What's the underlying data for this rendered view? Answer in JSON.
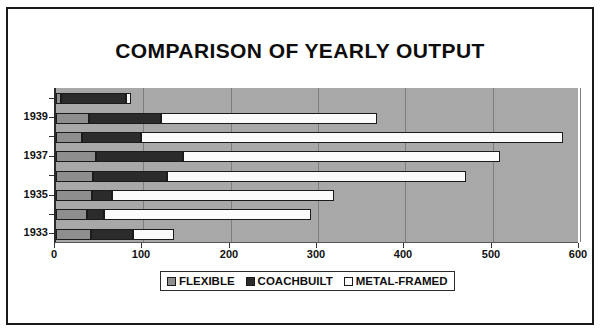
{
  "chart_data": {
    "type": "bar",
    "orientation": "horizontal",
    "stacked": true,
    "title": "COMPARISON OF YEARLY OUTPUT",
    "xlabel": "",
    "ylabel": "",
    "xlim": [
      0,
      600
    ],
    "xticks": [
      "0",
      "100",
      "200",
      "300",
      "400",
      "500",
      "600"
    ],
    "xtick_values": [
      0,
      100,
      200,
      300,
      400,
      500,
      600
    ],
    "grid": true,
    "grid_axis": "x",
    "legend_position": "bottom",
    "categories": [
      "1933",
      "1934",
      "1935",
      "1936",
      "1937",
      "1938",
      "1939",
      "1940"
    ],
    "visible_ytick_labels": [
      "1939",
      "1937",
      "1935",
      "1933"
    ],
    "series": [
      {
        "name": "FLEXIBLE",
        "color": "#8e8e8e",
        "values": [
          40,
          36,
          41,
          42,
          46,
          30,
          38,
          6
        ]
      },
      {
        "name": "COACHBUILT",
        "color": "#2b2b2b",
        "values": [
          48,
          19,
          23,
          85,
          99,
          67,
          82,
          74
        ]
      },
      {
        "name": "METAL-FRAMED",
        "color": "#fbfbfb",
        "values": [
          47,
          237,
          254,
          343,
          363,
          483,
          248,
          6
        ]
      }
    ],
    "totals": [
      135,
      292,
      318,
      470,
      508,
      580,
      368,
      86
    ]
  },
  "legend": {
    "items": [
      {
        "label": "FLEXIBLE",
        "swatch": "flexible"
      },
      {
        "label": "COACHBUILT",
        "swatch": "coachbuilt"
      },
      {
        "label": "METAL-FRAMED",
        "swatch": "metal"
      }
    ]
  }
}
